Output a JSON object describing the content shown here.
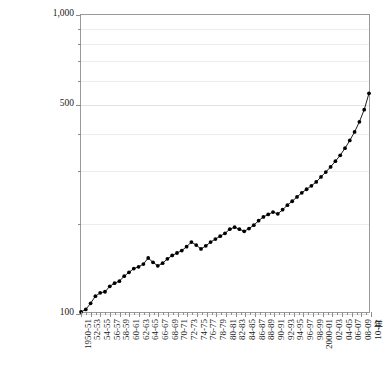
{
  "chart_data": {
    "type": "line",
    "title": "",
    "subtitle": "",
    "xlabel": "年",
    "ylabel": "",
    "yscale": "log",
    "ylim": [
      100,
      1000
    ],
    "ytick_labels": [
      "100",
      "500",
      "1,000"
    ],
    "ytick_values": [
      100,
      500,
      1000
    ],
    "yminor_values": [
      200,
      300,
      400,
      600,
      700,
      800,
      900
    ],
    "grid": true,
    "legend": false,
    "marker": "filled-circle",
    "line_color": "#000000",
    "marker_color": "#000000",
    "frame_color": "#9a9a9a",
    "grid_color": "#ececec",
    "xtick_labels": [
      "1950-51",
      "52-53",
      "54-55",
      "56-57",
      "58-59",
      "60-61",
      "62-63",
      "64-65",
      "66-67",
      "68-69",
      "70-71",
      "72-73",
      "74-75",
      "76-77",
      "78-79",
      "80-81",
      "82-83",
      "84-85",
      "86-87",
      "88-89",
      "90-91",
      "92-93",
      "94-95",
      "96-97",
      "98-99",
      "2000-01",
      "02-03",
      "04-05",
      "06-07",
      "08-09",
      "10-11"
    ],
    "x": [
      "1950-51",
      "1951-52",
      "1952-53",
      "1953-54",
      "1954-55",
      "1955-56",
      "1956-57",
      "1957-58",
      "1958-59",
      "1959-60",
      "1960-61",
      "1961-62",
      "1962-63",
      "1963-64",
      "1964-65",
      "1965-66",
      "1966-67",
      "1967-68",
      "1968-69",
      "1969-70",
      "1970-71",
      "1971-72",
      "1972-73",
      "1973-74",
      "1974-75",
      "1975-76",
      "1976-77",
      "1977-78",
      "1978-79",
      "1979-80",
      "1980-81",
      "1981-82",
      "1982-83",
      "1983-84",
      "1984-85",
      "1985-86",
      "1986-87",
      "1987-88",
      "1988-89",
      "1989-90",
      "1990-91",
      "1991-92",
      "1992-93",
      "1993-94",
      "1994-95",
      "1995-96",
      "1996-97",
      "1997-98",
      "1998-99",
      "1999-2000",
      "2000-01",
      "2001-02",
      "2002-03",
      "2003-04",
      "2004-05",
      "2005-06",
      "2006-07",
      "2007-08",
      "2008-09",
      "2009-10",
      "2010-11"
    ],
    "values": [
      100,
      102,
      107,
      113,
      116,
      117,
      122,
      125,
      127,
      132,
      136,
      140,
      142,
      145,
      152,
      147,
      143,
      146,
      151,
      155,
      158,
      161,
      166,
      172,
      168,
      163,
      167,
      172,
      176,
      180,
      184,
      190,
      193,
      190,
      187,
      191,
      196,
      203,
      209,
      213,
      217,
      214,
      221,
      229,
      236,
      244,
      252,
      259,
      266,
      274,
      285,
      296,
      308,
      322,
      337,
      356,
      378,
      404,
      437,
      480,
      545
    ]
  }
}
